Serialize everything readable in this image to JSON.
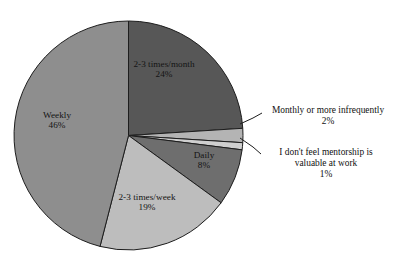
{
  "chart_data": {
    "type": "pie",
    "title": "",
    "subtitle": "",
    "legend_position": "none",
    "grid": false,
    "labels_on_slices": true,
    "categories": [
      "2-3 times/month",
      "Monthly or more infrequently",
      "I don't feel mentorship is valuable at work",
      "Daily",
      "2-3 times/week",
      "Weekly"
    ],
    "values": [
      24,
      2,
      1,
      8,
      19,
      46
    ],
    "value_labels": [
      "24%",
      "2%",
      "1%",
      "8%",
      "19%",
      "46%"
    ],
    "units": "percent",
    "total": 100,
    "start_angle_deg": 0,
    "direction": "clockwise",
    "slice_colors": [
      "#575757",
      "#b4b4b4",
      "#cfcfcf",
      "#6e6e6e",
      "#bdbdbd",
      "#8e8e8e"
    ],
    "slices": [
      {
        "name": "2-3 times/month",
        "value": 24,
        "label": "24%",
        "color": "#575757"
      },
      {
        "name": "Monthly or more infrequently",
        "value": 2,
        "label": "2%",
        "color": "#b4b4b4"
      },
      {
        "name": "I don't feel mentorship is valuable at work",
        "value": 1,
        "label": "1%",
        "color": "#cfcfcf"
      },
      {
        "name": "Daily",
        "value": 8,
        "label": "8%",
        "color": "#6e6e6e"
      },
      {
        "name": "2-3 times/week",
        "value": 19,
        "label": "19%",
        "color": "#bdbdbd"
      },
      {
        "name": "Weekly",
        "value": 46,
        "label": "46%",
        "color": "#8e8e8e"
      }
    ]
  },
  "pie_labels": {
    "month": {
      "name": "2-3 times/month",
      "pct": "24%"
    },
    "weekly": {
      "name": "Weekly",
      "pct": "46%"
    },
    "week": {
      "name": "2-3 times/week",
      "pct": "19%"
    },
    "daily": {
      "name": "Daily",
      "pct": "8%"
    }
  },
  "callouts": {
    "infrequent": {
      "name": "Monthly or more infrequently",
      "pct": "2%"
    },
    "novalue": {
      "name_line1": "I don't feel mentorship is",
      "name_line2": "valuable at work",
      "pct": "1%"
    }
  },
  "colors": {
    "background": "#ffffff",
    "outline": "#1d1d1d",
    "text": "#141414"
  }
}
